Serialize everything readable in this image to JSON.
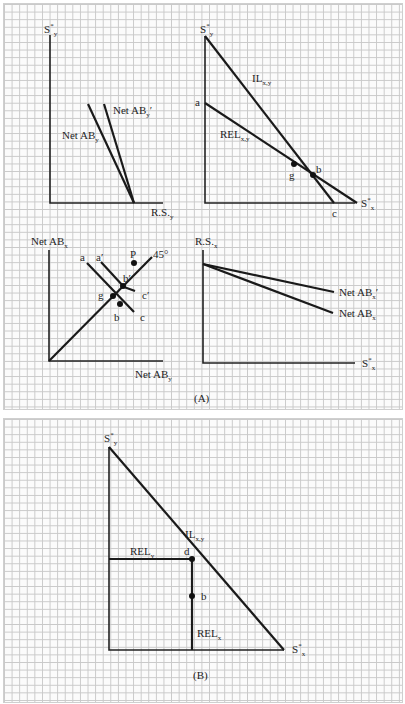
{
  "panels": [
    {
      "id": "A",
      "caption": "(A)"
    },
    {
      "id": "B",
      "caption": "(B)"
    }
  ],
  "panel_a": {
    "top_left": {
      "y_axis": "S*y",
      "x_axis": "R.S.y",
      "lines": [
        {
          "name": "Net AB'y",
          "label": "Net AB'y"
        },
        {
          "name": "Net ABy",
          "label": "Net ABy"
        }
      ]
    },
    "top_right": {
      "y_axis": "S*y",
      "x_axis": "S*x",
      "lines": [
        {
          "name": "IL x,y",
          "label": "ILx,y"
        },
        {
          "name": "REL x,y",
          "label": "RELx,y"
        }
      ],
      "points": [
        "a",
        "g",
        "b",
        "c"
      ]
    },
    "bottom_left": {
      "y_axis": "Net ABx",
      "x_axis": "Net ABy",
      "lines": [
        {
          "name": "45 degree",
          "label": "45°"
        },
        {
          "name": "abc",
          "labels": [
            "a",
            "b",
            "c"
          ]
        },
        {
          "name": "a'b'c'",
          "labels": [
            "a'",
            "b'",
            "c'"
          ]
        }
      ],
      "points": [
        "P",
        "b'",
        "g",
        "b"
      ]
    },
    "bottom_right": {
      "y_axis": "R.S.x",
      "x_axis": "S*x",
      "lines": [
        {
          "name": "Net AB'x",
          "label": "Net AB'x"
        },
        {
          "name": "Net ABx",
          "label": "Net ABx"
        }
      ]
    }
  },
  "panel_b": {
    "y_axis": "S*y",
    "x_axis": "S*x",
    "lines": [
      {
        "name": "IL x,y",
        "label": "ILx,y"
      },
      {
        "name": "REL y",
        "label": "RELy"
      },
      {
        "name": "REL x",
        "label": "RELx"
      }
    ],
    "points": [
      "d",
      "b"
    ]
  },
  "labels": {
    "S": "S",
    "star": "*",
    "y": "y",
    "x": "x",
    "xy": "x,y",
    "net_ab": "Net AB",
    "rs": "R.S.",
    "il": "IL",
    "rel": "REL",
    "prime": "′",
    "deg45": "45°",
    "a": "a",
    "a_prime": "a′",
    "b": "b",
    "b_prime": "b′",
    "c": "c",
    "c_prime": "c′",
    "g": "g",
    "d": "d",
    "p": "P",
    "caption_a": "(A)",
    "caption_b": "(B)"
  }
}
